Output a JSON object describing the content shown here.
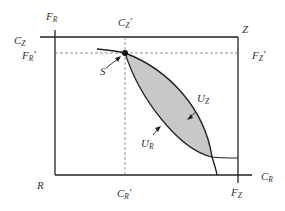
{
  "diagram": {
    "type": "edgeworth-box",
    "colors": {
      "axis": "#222222",
      "curve": "#222222",
      "lens_fill": "#c8c8c8",
      "dashed": "#777777",
      "text": "#333333"
    },
    "labels": {
      "F_R": {
        "main": "F",
        "sub": "R",
        "prime": ""
      },
      "C_Z_prime": {
        "main": "C",
        "sub": "Z",
        "prime": "′"
      },
      "Z": {
        "main": "Z"
      },
      "C_Z": {
        "main": "C",
        "sub": "Z",
        "prime": ""
      },
      "F_R_prime": {
        "main": "F",
        "sub": "R",
        "prime": "′"
      },
      "F_Z_prime": {
        "main": "F",
        "sub": "Z",
        "prime": "′"
      },
      "S": {
        "main": "S"
      },
      "U_Z": {
        "main": "U",
        "sub": "Z"
      },
      "U_R": {
        "main": "U",
        "sub": "R"
      },
      "R": {
        "main": "R"
      },
      "C_R_prime": {
        "main": "C",
        "sub": "R",
        "prime": "′"
      },
      "F_Z": {
        "main": "F",
        "sub": "Z",
        "prime": ""
      },
      "C_R": {
        "main": "C",
        "sub": "R",
        "prime": ""
      }
    }
  }
}
